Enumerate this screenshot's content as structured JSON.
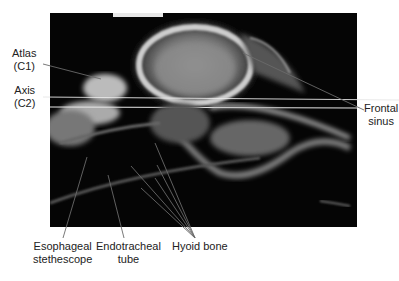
{
  "figure": {
    "labels": {
      "atlas": [
        "Atlas",
        "(C1)"
      ],
      "axis": [
        "Axis",
        "(C2)"
      ],
      "frontal_sinus": [
        "Frontal",
        "sinus"
      ],
      "esophageal_stethescope": [
        "Esophageal",
        "stethescope"
      ],
      "endotracheal_tube": [
        "Endotracheal",
        "tube"
      ],
      "hyoid_bone": [
        "Hyoid bone"
      ]
    },
    "colors": {
      "background": "#ffffff",
      "radiograph": "#050505",
      "bone": "#d8d8d8",
      "leader_line": "#6a6a6a",
      "text": "#222222"
    }
  }
}
